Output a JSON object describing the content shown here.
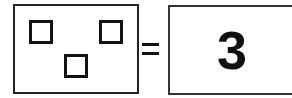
{
  "left_panel": {
    "shape": "square",
    "count_shown": 3,
    "squares": [
      {
        "x": 29,
        "y": 20
      },
      {
        "x": 99,
        "y": 20
      },
      {
        "x": 64,
        "y": 54
      }
    ]
  },
  "operator": "=",
  "right_panel": {
    "answer": "3"
  }
}
